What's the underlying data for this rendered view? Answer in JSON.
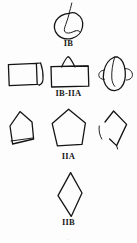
{
  "figure": {
    "type": "line-drawing-plate",
    "background_color": "#fdfdfd",
    "ink_color": "#141414",
    "width": 137,
    "height": 243,
    "rows": [
      {
        "id": "row-ib",
        "label": "IB",
        "label_y": 41,
        "shape_count": 1,
        "shapes": [
          {
            "name": "leaf-outline-with-stem",
            "position": "center",
            "x": 48,
            "y": 2,
            "w": 42,
            "h": 40
          }
        ]
      },
      {
        "id": "row-ib-iia",
        "label": "IB-IIA",
        "label_y": 90,
        "shape_count": 3,
        "shapes": [
          {
            "name": "rectangle-with-right-flap",
            "position": "left",
            "x": 6,
            "y": 60,
            "w": 40,
            "h": 30
          },
          {
            "name": "rectangle-with-triangular-peak",
            "position": "center",
            "x": 48,
            "y": 55,
            "w": 42,
            "h": 34
          },
          {
            "name": "oval-with-side-lobes",
            "position": "right",
            "x": 96,
            "y": 56,
            "w": 38,
            "h": 36
          }
        ]
      },
      {
        "id": "row-iia",
        "label": "IIA",
        "label_y": 154,
        "shape_count": 3,
        "shapes": [
          {
            "name": "left-leaning-quadrilateral",
            "position": "left",
            "x": 6,
            "y": 110,
            "w": 38,
            "h": 40
          },
          {
            "name": "pentagon",
            "position": "center",
            "x": 48,
            "y": 108,
            "w": 44,
            "h": 42
          },
          {
            "name": "open-quadrilateral-with-gap",
            "position": "right",
            "x": 96,
            "y": 109,
            "w": 38,
            "h": 42
          }
        ]
      },
      {
        "id": "row-iib",
        "label": "IIB",
        "label_y": 220,
        "shape_count": 1,
        "shapes": [
          {
            "name": "diamond-rhombus",
            "position": "center",
            "x": 52,
            "y": 172,
            "w": 34,
            "h": 46
          }
        ]
      }
    ],
    "footer_artifact": "—"
  }
}
